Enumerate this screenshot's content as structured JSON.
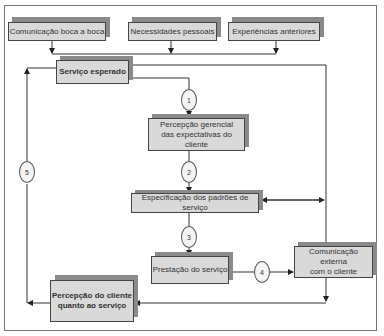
{
  "diagram": {
    "top_inputs": [
      {
        "label": "Comunicação boca a boca"
      },
      {
        "label": "Necessidades pessoais"
      },
      {
        "label": "Experiências anteriores"
      }
    ],
    "expected_service": {
      "label": "Serviço esperado"
    },
    "management_perception": {
      "line1": "Percepção gerencial",
      "line2": "das expectativas do cliente"
    },
    "service_standards": {
      "label": "Especificação dos padrões de serviço"
    },
    "service_delivery": {
      "label": "Prestação do serviço"
    },
    "external_communication": {
      "line1": "Comunicação externa",
      "line2": "com o cliente"
    },
    "perceived_service": {
      "line1": "Percepção do cliente",
      "line2": "quanto ao serviço"
    },
    "gaps": [
      "1",
      "2",
      "3",
      "4",
      "5"
    ]
  }
}
